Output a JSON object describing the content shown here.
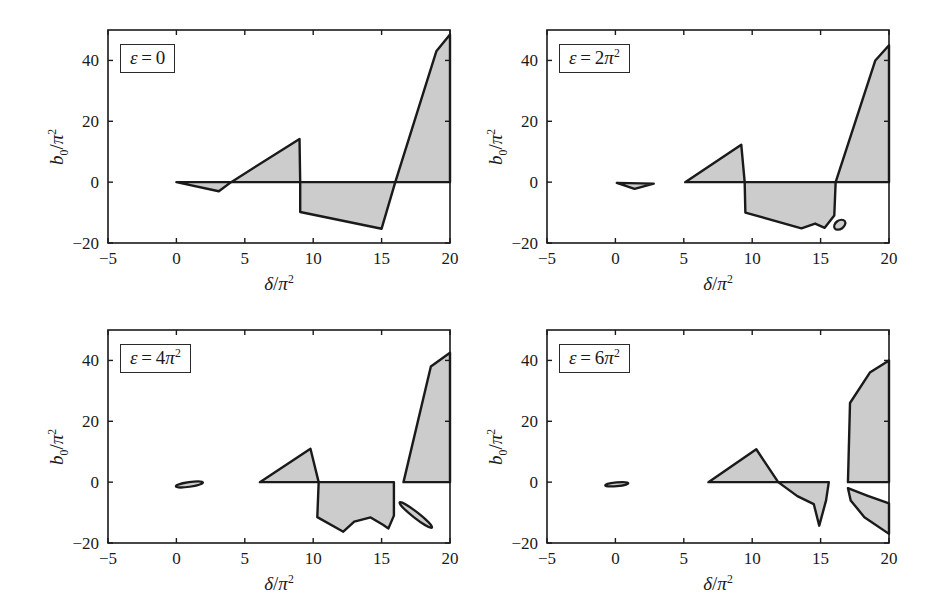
{
  "figure": {
    "background": "#ffffff",
    "fill_color": "#cccccc",
    "line_color": "#1a1a1a",
    "panel_count": 4
  },
  "axes": {
    "xlabel": "δ/π²",
    "xlabel_parts": {
      "var": "δ",
      "slash": "/",
      "den": "π",
      "exp": "2"
    },
    "ylabel": "b₀/π²",
    "ylabel_parts": {
      "var": "b",
      "varsub": "0",
      "slash": "/",
      "den": "π",
      "exp": "2"
    },
    "xlim": [
      -5,
      20
    ],
    "ylim": [
      -20,
      50
    ],
    "xticks": [
      -5,
      0,
      5,
      10,
      15,
      20
    ],
    "xticklabels": [
      "−5",
      "0",
      "5",
      "10",
      "15",
      "20"
    ],
    "yticks": [
      -20,
      0,
      20,
      40
    ],
    "yticklabels": [
      "−20",
      "0",
      "20",
      "40"
    ],
    "grid": false
  },
  "chart_data": {
    "type": "area",
    "title": "",
    "xlabel": "δ/π²",
    "ylabel": "b₀/π²",
    "xlim": [
      -5,
      20
    ],
    "ylim": [
      -20,
      50
    ],
    "xticks": [
      -5,
      0,
      5,
      10,
      15,
      20
    ],
    "yticks": [
      -20,
      0,
      20,
      40
    ],
    "grid": false,
    "legend": "none",
    "panels": [
      {
        "id": "panel-eps-0",
        "label": "ε = 0",
        "label_parts": {
          "var": "ε",
          "eq": "=",
          "value": "0"
        },
        "epsilon_value": 0,
        "position": "top-left",
        "regions": [
          {
            "name": "first-tongue-lower",
            "note": "thin sliver below zero from delta=0 to delta=4",
            "polygon": [
              [
                0,
                0
              ],
              [
                3.1,
                -3.0
              ],
              [
                4.0,
                0
              ]
            ]
          },
          {
            "name": "second-tongue-upper",
            "note": "triangle rising from delta=4 to peak at delta=9",
            "polygon": [
              [
                4.0,
                0
              ],
              [
                9.0,
                14.2
              ],
              [
                9.05,
                0
              ]
            ]
          },
          {
            "name": "second-tongue-lower",
            "note": "region below zero between delta=9 and delta=16",
            "polygon": [
              [
                9.05,
                0
              ],
              [
                9.05,
                -9.8
              ],
              [
                15.0,
                -15.3
              ],
              [
                16.0,
                0
              ]
            ]
          },
          {
            "name": "third-tongue-upper",
            "note": "steep tongue at right edge",
            "polygon": [
              [
                16.0,
                0
              ],
              [
                19.0,
                43.0
              ],
              [
                20.0,
                48.5
              ],
              [
                20.0,
                0
              ]
            ]
          }
        ]
      },
      {
        "id": "panel-eps-2pi2",
        "label": "ε = 2π²",
        "label_parts": {
          "var": "ε",
          "eq": "=",
          "coef": "2",
          "den": "π",
          "exp": "2"
        },
        "epsilon_value": "2π²",
        "position": "top-right",
        "regions": [
          {
            "name": "origin-sliver",
            "note": "small detached sliver near delta=0..2.8 below zero",
            "polygon": [
              [
                0.1,
                -0.25
              ],
              [
                2.8,
                -0.5
              ],
              [
                1.4,
                -2.2
              ]
            ]
          },
          {
            "name": "second-tongue-upper",
            "note": "triangle from delta=5.1 peaking at delta=9.2",
            "polygon": [
              [
                5.1,
                0
              ],
              [
                9.2,
                12.3
              ],
              [
                9.45,
                0
              ]
            ]
          },
          {
            "name": "second-tongue-lower",
            "note": "region below zero with small notch near delta=14.5",
            "polygon": [
              [
                9.45,
                0
              ],
              [
                9.5,
                -10.0
              ],
              [
                13.6,
                -15.2
              ],
              [
                14.6,
                -13.6
              ],
              [
                15.3,
                -15.0
              ],
              [
                16.0,
                -11.0
              ],
              [
                16.1,
                0
              ]
            ]
          },
          {
            "name": "detached-ellipse",
            "note": "small isolated closed blob",
            "ellipse": {
              "cx": 16.4,
              "cy": -14.0,
              "rx": 0.45,
              "ry": 1.4,
              "rotate": -35
            }
          },
          {
            "name": "third-tongue-upper",
            "note": "steep tongue at right edge",
            "polygon": [
              [
                16.1,
                0
              ],
              [
                19.0,
                40.0
              ],
              [
                20.0,
                45.0
              ],
              [
                20.0,
                0
              ]
            ]
          }
        ]
      },
      {
        "id": "panel-eps-4pi2",
        "label": "ε = 4π²",
        "label_parts": {
          "var": "ε",
          "eq": "=",
          "coef": "4",
          "den": "π",
          "exp": "2"
        },
        "epsilon_value": "4π²",
        "position": "bottom-left",
        "regions": [
          {
            "name": "origin-sliver",
            "note": "small detached lens near delta=0..2",
            "ellipse": {
              "cx": 0.95,
              "cy": -0.75,
              "rx": 1.0,
              "ry": 0.78,
              "rotate": -8
            }
          },
          {
            "name": "second-tongue-upper",
            "note": "triangle from delta=6.1 peaking at delta=9.8",
            "polygon": [
              [
                6.1,
                0
              ],
              [
                9.8,
                11.0
              ],
              [
                10.4,
                0
              ]
            ]
          },
          {
            "name": "second-tongue-lower",
            "note": "broad lower region with concave scallop near delta=13.5",
            "polygon": [
              [
                10.4,
                0
              ],
              [
                10.3,
                -11.5
              ],
              [
                12.2,
                -16.3
              ],
              [
                13.0,
                -13.0
              ],
              [
                14.2,
                -11.6
              ],
              [
                15.1,
                -14.0
              ],
              [
                15.5,
                -15.2
              ],
              [
                15.9,
                -11.0
              ],
              [
                15.9,
                0
              ]
            ]
          },
          {
            "name": "detached-lens",
            "note": "isolated elongated blob below zero near delta 16.5-18.7",
            "ellipse": {
              "cx": 17.5,
              "cy": -10.8,
              "rx": 1.5,
              "ry": 0.95,
              "rotate": 38
            }
          },
          {
            "name": "third-tongue-upper",
            "note": "steep tongue at right edge starting delta=16.6",
            "polygon": [
              [
                16.6,
                0
              ],
              [
                18.6,
                38.0
              ],
              [
                20.0,
                42.5
              ],
              [
                20.0,
                0
              ]
            ]
          }
        ]
      },
      {
        "id": "panel-eps-6pi2",
        "label": "ε = 6π²",
        "label_parts": {
          "var": "ε",
          "eq": "=",
          "coef": "6",
          "den": "π",
          "exp": "2"
        },
        "epsilon_value": "6π²",
        "position": "bottom-right",
        "regions": [
          {
            "name": "origin-sliver",
            "note": "small detached lens near delta=-0.6..0.9",
            "ellipse": {
              "cx": 0.1,
              "cy": -0.7,
              "rx": 0.85,
              "ry": 0.62,
              "rotate": -5
            }
          },
          {
            "name": "second-tongue-upper",
            "note": "triangle from delta=6.8 peaking at delta=10.3",
            "polygon": [
              [
                6.8,
                0
              ],
              [
                10.3,
                10.8
              ],
              [
                11.9,
                0
              ]
            ]
          },
          {
            "name": "second-tongue-lower",
            "note": "slim lower region with sharp spike at delta=14.9",
            "polygon": [
              [
                11.9,
                0
              ],
              [
                13.3,
                -4.6
              ],
              [
                14.5,
                -7.2
              ],
              [
                14.9,
                -14.3
              ],
              [
                15.4,
                -6.0
              ],
              [
                15.6,
                0
              ]
            ]
          },
          {
            "name": "third-tongue-upper",
            "note": "broad right tongue above zero from delta=17",
            "polygon": [
              [
                17.0,
                0
              ],
              [
                17.15,
                26.0
              ],
              [
                18.6,
                36.0
              ],
              [
                20.0,
                40.0
              ],
              [
                20.0,
                0
              ]
            ]
          },
          {
            "name": "third-tongue-lower",
            "note": "crescent below zero at right edge",
            "polygon": [
              [
                17.0,
                -2.0
              ],
              [
                18.4,
                -4.4
              ],
              [
                20.0,
                -7.0
              ],
              [
                20.0,
                -17.0
              ],
              [
                18.2,
                -11.5
              ],
              [
                17.2,
                -6.0
              ]
            ]
          }
        ]
      }
    ]
  }
}
